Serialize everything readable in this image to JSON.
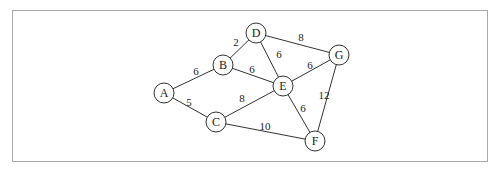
{
  "graph": {
    "nodes": [
      {
        "id": "A",
        "label": "A",
        "x": 164,
        "y": 93
      },
      {
        "id": "B",
        "label": "B",
        "x": 223,
        "y": 65
      },
      {
        "id": "C",
        "label": "C",
        "x": 216,
        "y": 122
      },
      {
        "id": "D",
        "label": "D",
        "x": 256,
        "y": 33
      },
      {
        "id": "E",
        "label": "E",
        "x": 283,
        "y": 86
      },
      {
        "id": "G",
        "label": "G",
        "x": 339,
        "y": 55
      },
      {
        "id": "F",
        "label": "F",
        "x": 315,
        "y": 141
      }
    ],
    "edges": [
      {
        "from": "A",
        "to": "B",
        "weight": "6",
        "lx": 196,
        "ly": 75
      },
      {
        "from": "A",
        "to": "C",
        "weight": "5",
        "lx": 189,
        "ly": 106
      },
      {
        "from": "B",
        "to": "D",
        "weight": "2",
        "lx": 236,
        "ly": 46
      },
      {
        "from": "B",
        "to": "E",
        "weight": "6",
        "lx": 252,
        "ly": 73
      },
      {
        "from": "D",
        "to": "E",
        "weight": "6",
        "lx": 279,
        "ly": 58
      },
      {
        "from": "D",
        "to": "G",
        "weight": "8",
        "lx": 301,
        "ly": 41
      },
      {
        "from": "E",
        "to": "G",
        "weight": "6",
        "lx": 310,
        "ly": 69
      },
      {
        "from": "C",
        "to": "E",
        "weight": "8",
        "lx": 242,
        "ly": 102
      },
      {
        "from": "E",
        "to": "F",
        "weight": "6",
        "lx": 303,
        "ly": 112
      },
      {
        "from": "G",
        "to": "F",
        "weight": "12",
        "lx": 324,
        "ly": 99
      },
      {
        "from": "C",
        "to": "F",
        "weight": "10",
        "lx": 265,
        "ly": 130
      }
    ],
    "node_radius": 10
  }
}
